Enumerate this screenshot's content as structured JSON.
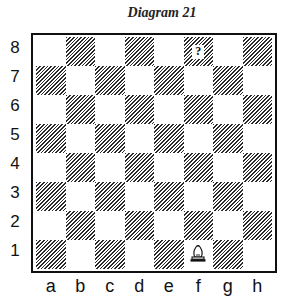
{
  "title": "Diagram 21",
  "ranks": [
    "8",
    "7",
    "6",
    "5",
    "4",
    "3",
    "2",
    "1"
  ],
  "files": [
    "a",
    "b",
    "c",
    "d",
    "e",
    "f",
    "g",
    "h"
  ],
  "board": {
    "pieces": [
      {
        "square": "f1",
        "piece": "white-bishop",
        "color": "white"
      }
    ],
    "markers": [
      {
        "square": "f8",
        "symbol": "?"
      }
    ]
  },
  "colors": {
    "dark_square_hatch": "#2a2a2a",
    "light_square": "#ffffff",
    "border": "#111111"
  }
}
